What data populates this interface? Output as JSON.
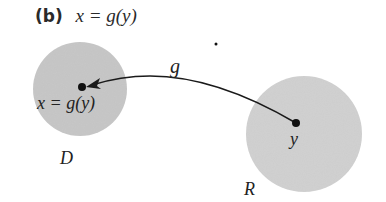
{
  "title": {
    "tag": "(b)",
    "equation": "x = g(y)"
  },
  "diagram": {
    "domain_circle": {
      "label": "D",
      "point_label": "x = g(y)",
      "fill": "#c8c8c8"
    },
    "range_circle": {
      "label": "R",
      "point_label": "y",
      "fill": "#d2d2d2"
    },
    "mapping": {
      "label": "g",
      "direction": "from y in R to x in D"
    },
    "stray_dot": true
  }
}
